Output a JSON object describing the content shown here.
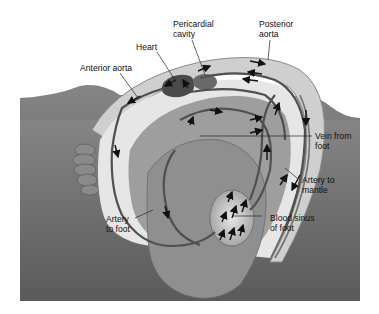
{
  "diagram": {
    "labels": {
      "heart": "Heart",
      "pericardial_cavity": "Pericardial\ncavity",
      "posterior_aorta": "Posterior\naorta",
      "anterior_aorta": "Anterior aorta",
      "vein_from_foot": "Vein from\nfoot",
      "artery_to_mantle": "Artery to\nmantle",
      "artery_to_foot": "Artery\nto foot",
      "blood_sinus_of_foot": "Blood sinus\nof foot"
    },
    "colors": {
      "background_rock": "#6e6e6e",
      "shell_light": "#d9d9d9",
      "body": "#8c8c8c",
      "foot": "#9a9a9a",
      "heart": "#4a4a4a",
      "vessel": "#555555",
      "arrow": "#111111"
    }
  }
}
